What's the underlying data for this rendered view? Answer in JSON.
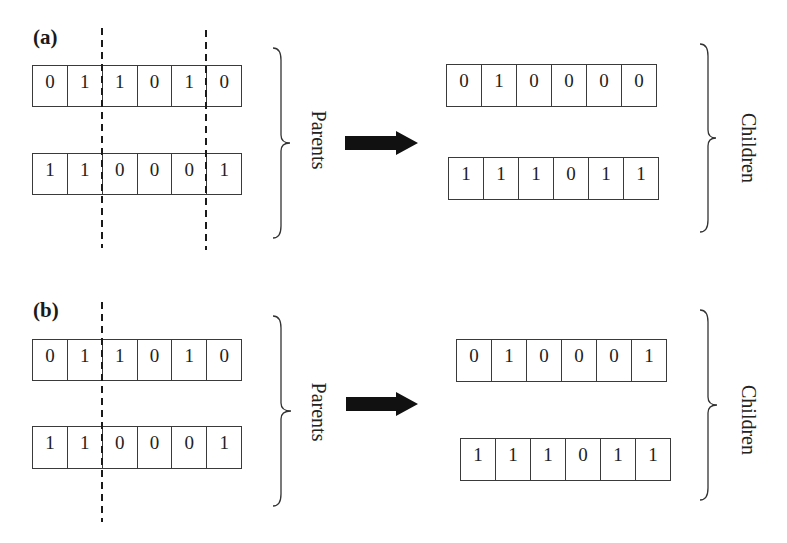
{
  "panels": [
    {
      "id": "a",
      "label": "(a)",
      "label_pos": [
        33,
        27
      ],
      "parents_label": "Parents",
      "children_label": "Children",
      "crossover_type": "two-point",
      "parents": [
        {
          "bits": [
            "0",
            "1",
            "1",
            "0",
            "1",
            "0"
          ],
          "x": 32,
          "y": 65,
          "w": 209,
          "h": 42
        },
        {
          "bits": [
            "1",
            "1",
            "0",
            "0",
            "0",
            "1"
          ],
          "x": 32,
          "y": 153,
          "w": 209,
          "h": 42
        }
      ],
      "children": [
        {
          "bits": [
            "0",
            "1",
            "0",
            "0",
            "0",
            "0"
          ],
          "x": 446,
          "y": 64,
          "w": 210,
          "h": 43
        },
        {
          "bits": [
            "1",
            "1",
            "1",
            "0",
            "1",
            "1"
          ],
          "x": 448,
          "y": 157,
          "w": 210,
          "h": 43
        }
      ],
      "cut_lines": [
        {
          "x": 102,
          "y1": 28,
          "y2": 248
        },
        {
          "x": 206,
          "y1": 30,
          "y2": 250
        }
      ],
      "parents_brace": {
        "x": 273,
        "y1": 48,
        "y2": 238,
        "tipx": 290
      },
      "parents_label_pos": [
        318,
        140
      ],
      "arrow": {
        "x1": 345,
        "x2": 418,
        "y": 143
      },
      "children_brace": {
        "x": 700,
        "y1": 44,
        "y2": 232,
        "tipx": 716
      },
      "children_label_pos": [
        748,
        148
      ]
    },
    {
      "id": "b",
      "label": "(b)",
      "label_pos": [
        33,
        300
      ],
      "parents_label": "Parents",
      "children_label": "Children",
      "crossover_type": "one-point",
      "parents": [
        {
          "bits": [
            "0",
            "1",
            "1",
            "0",
            "1",
            "0"
          ],
          "x": 32,
          "y": 339,
          "w": 209,
          "h": 42
        },
        {
          "bits": [
            "1",
            "1",
            "0",
            "0",
            "0",
            "1"
          ],
          "x": 32,
          "y": 426,
          "w": 209,
          "h": 43
        }
      ],
      "children": [
        {
          "bits": [
            "0",
            "1",
            "0",
            "0",
            "0",
            "1"
          ],
          "x": 456,
          "y": 339,
          "w": 210,
          "h": 43
        },
        {
          "bits": [
            "1",
            "1",
            "1",
            "0",
            "1",
            "1"
          ],
          "x": 460,
          "y": 438,
          "w": 210,
          "h": 43
        }
      ],
      "cut_lines": [
        {
          "x": 102,
          "y1": 302,
          "y2": 522
        }
      ],
      "parents_brace": {
        "x": 273,
        "y1": 316,
        "y2": 506,
        "tipx": 291
      },
      "parents_label_pos": [
        318,
        412
      ],
      "arrow": {
        "x1": 346,
        "x2": 418,
        "y": 404
      },
      "children_brace": {
        "x": 700,
        "y1": 310,
        "y2": 500,
        "tipx": 717
      },
      "children_label_pos": [
        748,
        420
      ]
    }
  ],
  "colors": {
    "line": "#333333",
    "arrow": "#111111",
    "text": "#222222"
  }
}
